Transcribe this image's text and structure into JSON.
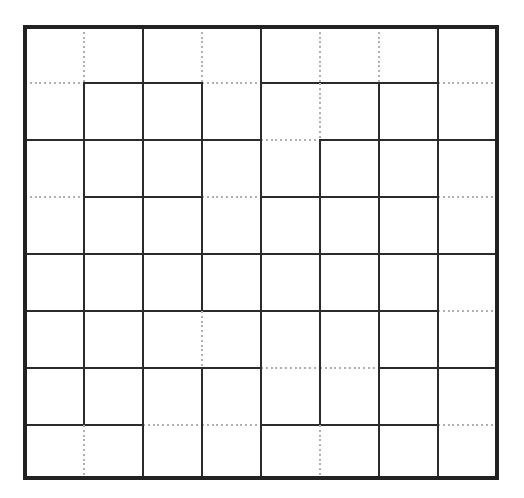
{
  "figure": {
    "background_color": "#ffffff",
    "solid_color": "#2b2b2b",
    "dotted_color": "#b0b0b0",
    "border_color": "#222222",
    "rows": 8,
    "columns": 8
  },
  "geometry": {
    "x_coords": [
      25,
      84,
      143,
      202,
      261,
      320,
      379,
      438,
      497
    ],
    "y_coords": [
      27,
      83,
      140,
      197,
      254,
      311,
      368,
      425,
      478
    ],
    "cell_width": 59,
    "cell_height": 56
  },
  "chart_data": {
    "type": "heatmap",
    "xlabel": "",
    "ylabel": "",
    "categories": [
      "1",
      "2",
      "3",
      "4",
      "5",
      "6",
      "7",
      "8"
    ],
    "rows": 8,
    "columns": 8,
    "legend": [
      {
        "name": "solid edge",
        "color": "#2b2b2b",
        "style": "solid"
      },
      {
        "name": "dotted edge",
        "color": "#b0b0b0",
        "style": "dotted"
      }
    ],
    "horizontal_edges": [
      [
        "border",
        "border",
        "border",
        "border",
        "border",
        "border",
        "border",
        "border"
      ],
      [
        "dotted",
        "solid",
        "solid",
        "dotted",
        "solid",
        "solid",
        "solid",
        "dotted"
      ],
      [
        "solid",
        "solid",
        "solid",
        "solid",
        "dotted",
        "solid",
        "solid",
        "solid"
      ],
      [
        "dotted",
        "solid",
        "solid",
        "dotted",
        "solid",
        "solid",
        "solid",
        "dotted"
      ],
      [
        "solid",
        "solid",
        "solid",
        "solid",
        "solid",
        "solid",
        "solid",
        "solid"
      ],
      [
        "solid",
        "solid",
        "solid",
        "solid",
        "solid",
        "solid",
        "solid",
        "dotted"
      ],
      [
        "solid",
        "solid",
        "solid",
        "solid",
        "dotted",
        "dotted",
        "solid",
        "solid"
      ],
      [
        "solid",
        "solid",
        "dotted",
        "dotted",
        "solid",
        "solid",
        "solid",
        "dotted"
      ],
      [
        "border",
        "border",
        "border",
        "border",
        "border",
        "border",
        "border",
        "border"
      ]
    ],
    "vertical_edges": [
      [
        "border",
        "dotted",
        "solid",
        "dotted",
        "solid",
        "dotted",
        "dotted",
        "solid",
        "border"
      ],
      [
        "border",
        "solid",
        "solid",
        "solid",
        "solid",
        "dotted",
        "solid",
        "solid",
        "border"
      ],
      [
        "border",
        "solid",
        "solid",
        "solid",
        "solid",
        "solid",
        "solid",
        "solid",
        "border"
      ],
      [
        "border",
        "solid",
        "solid",
        "solid",
        "solid",
        "solid",
        "solid",
        "solid",
        "border"
      ],
      [
        "border",
        "solid",
        "solid",
        "solid",
        "solid",
        "solid",
        "solid",
        "solid",
        "border"
      ],
      [
        "border",
        "solid",
        "solid",
        "dotted",
        "solid",
        "solid",
        "solid",
        "solid",
        "border"
      ],
      [
        "border",
        "solid",
        "solid",
        "solid",
        "solid",
        "solid",
        "solid",
        "solid",
        "border"
      ],
      [
        "border",
        "dotted",
        "solid",
        "solid",
        "solid",
        "dotted",
        "solid",
        "solid",
        "border"
      ]
    ]
  }
}
